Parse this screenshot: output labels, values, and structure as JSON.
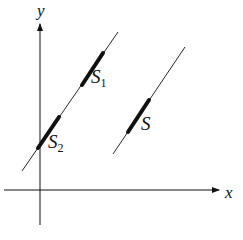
{
  "figure": {
    "axes": {
      "x_label": "x",
      "y_label": "y"
    },
    "lines": [
      {
        "id": "line-1",
        "segments": [
          {
            "label": "S",
            "subscript": "1"
          },
          {
            "label": "S",
            "subscript": "2"
          }
        ]
      },
      {
        "id": "line-2",
        "segments": [
          {
            "label": "S",
            "subscript": ""
          }
        ]
      }
    ],
    "colors": {
      "ink": "#111111",
      "background": "#ffffff"
    }
  }
}
